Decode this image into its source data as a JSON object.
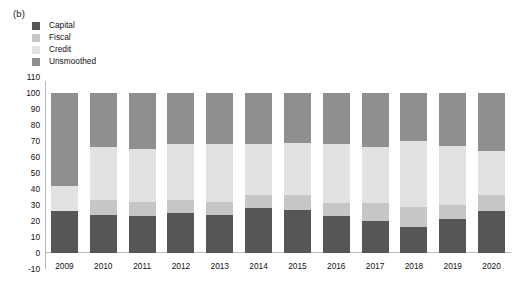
{
  "panel": {
    "label": "(b)"
  },
  "legend": {
    "position": "top-left",
    "items": [
      {
        "label": "Capital",
        "color": "#565656",
        "icon": "legend-swatch-icon"
      },
      {
        "label": "Fiscal",
        "color": "#c6c6c6",
        "icon": "legend-swatch-icon"
      },
      {
        "label": "Credit",
        "color": "#e2e2e2",
        "icon": "legend-swatch-icon"
      },
      {
        "label": "Unsmoothed",
        "color": "#8f8f8f",
        "icon": "legend-swatch-icon"
      }
    ]
  },
  "chart_data": {
    "type": "bar",
    "subtype": "stacked-bar-100",
    "title": "",
    "xlabel": "",
    "ylabel": "",
    "ylim": [
      -10,
      110
    ],
    "yticks": [
      110,
      100,
      90,
      80,
      70,
      60,
      50,
      40,
      30,
      20,
      10,
      0,
      -10
    ],
    "grid": false,
    "categories": [
      "2009",
      "2010",
      "2011",
      "2012",
      "2013",
      "2014",
      "2015",
      "2016",
      "2017",
      "2018",
      "2019",
      "2020"
    ],
    "series": [
      {
        "name": "Capital",
        "color": "#565656",
        "values": [
          26,
          24,
          23,
          25,
          24,
          28,
          27,
          23,
          20,
          16,
          21,
          26
        ]
      },
      {
        "name": "Fiscal",
        "color": "#c6c6c6",
        "values": [
          0,
          9,
          9,
          8,
          8,
          8,
          9,
          8,
          11,
          13,
          9,
          10
        ]
      },
      {
        "name": "Credit",
        "color": "#e2e2e2",
        "values": [
          16,
          33,
          33,
          35,
          36,
          32,
          33,
          37,
          35,
          41,
          37,
          28
        ]
      },
      {
        "name": "Unsmoothed",
        "color": "#8f8f8f",
        "values": [
          58,
          34,
          35,
          32,
          32,
          32,
          31,
          32,
          34,
          30,
          33,
          36
        ]
      }
    ],
    "cumulative_tops": {
      "capital": [
        26,
        24,
        23,
        25,
        24,
        28,
        27,
        23,
        20,
        16,
        21,
        26
      ],
      "fiscal": [
        26,
        33,
        32,
        33,
        32,
        36,
        36,
        31,
        31,
        29,
        30,
        36
      ],
      "credit": [
        42,
        66,
        65,
        68,
        68,
        68,
        69,
        68,
        66,
        70,
        67,
        64
      ],
      "unsmoothed": [
        100,
        100,
        100,
        100,
        100,
        100,
        100,
        100,
        100,
        100,
        100,
        100
      ]
    }
  }
}
